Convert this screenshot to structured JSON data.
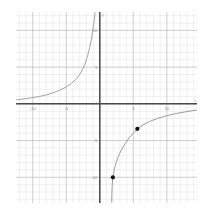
{
  "chart_data": {
    "type": "line",
    "title": "",
    "xlabel": "x",
    "ylabel": "y",
    "xlim": [
      -12.5,
      14.5
    ],
    "ylim": [
      -13.5,
      12.5
    ],
    "grid": true,
    "minor_grid": true,
    "minor_step": 1,
    "major_step": 5,
    "legend": "none",
    "x_ticks": [
      -10,
      -5,
      0,
      5,
      10
    ],
    "x_tick_labels": [
      "-10",
      "-5",
      "0",
      "5",
      "10"
    ],
    "y_ticks": [
      10,
      5,
      0,
      -5,
      -10
    ],
    "y_tick_labels": [
      "10",
      "5",
      "0",
      "-5",
      "-10"
    ],
    "series": [
      {
        "name": "upper-left-branch",
        "color": "#999999",
        "points": [
          {
            "x": -12.4,
            "y": 0.55
          },
          {
            "x": -11.0,
            "y": 0.7
          },
          {
            "x": -10.0,
            "y": 0.85
          },
          {
            "x": -9.0,
            "y": 1.0
          },
          {
            "x": -8.0,
            "y": 1.2
          },
          {
            "x": -7.0,
            "y": 1.5
          },
          {
            "x": -6.0,
            "y": 1.85
          },
          {
            "x": -5.0,
            "y": 2.3
          },
          {
            "x": -4.2,
            "y": 2.8
          },
          {
            "x": -3.5,
            "y": 3.4
          },
          {
            "x": -3.0,
            "y": 4.0
          },
          {
            "x": -2.5,
            "y": 4.8
          },
          {
            "x": -2.1,
            "y": 5.7
          },
          {
            "x": -1.8,
            "y": 6.6
          },
          {
            "x": -1.5,
            "y": 7.7
          },
          {
            "x": -1.25,
            "y": 8.8
          },
          {
            "x": -1.05,
            "y": 10.0
          },
          {
            "x": -0.85,
            "y": 11.2
          },
          {
            "x": -0.7,
            "y": 12.4
          }
        ]
      },
      {
        "name": "lower-right-branch",
        "color": "#8e8e8e",
        "points": [
          {
            "x": 1.78,
            "y": -13.4
          },
          {
            "x": 1.8,
            "y": -12.2
          },
          {
            "x": 1.85,
            "y": -11.1
          },
          {
            "x": 1.95,
            "y": -10.0
          },
          {
            "x": 2.15,
            "y": -9.0
          },
          {
            "x": 2.4,
            "y": -8.1
          },
          {
            "x": 2.75,
            "y": -7.2
          },
          {
            "x": 3.2,
            "y": -6.3
          },
          {
            "x": 3.8,
            "y": -5.4
          },
          {
            "x": 4.4,
            "y": -4.6
          },
          {
            "x": 5.1,
            "y": -3.9
          },
          {
            "x": 5.6,
            "y": -3.4
          },
          {
            "x": 6.4,
            "y": -2.9
          },
          {
            "x": 7.4,
            "y": -2.4
          },
          {
            "x": 8.6,
            "y": -2.0
          },
          {
            "x": 10.0,
            "y": -1.6
          },
          {
            "x": 11.5,
            "y": -1.3
          },
          {
            "x": 13.0,
            "y": -1.05
          },
          {
            "x": 14.4,
            "y": -0.85
          }
        ]
      }
    ],
    "marked_points": [
      {
        "x": 5.6,
        "y": -3.4,
        "label": ""
      },
      {
        "x": 1.95,
        "y": -10.0,
        "label": ""
      }
    ],
    "marker_color": "#111111"
  },
  "annotations": {
    "top_mark": "",
    "bottom_mark": ""
  },
  "colors": {
    "axis": "#4a4a4a",
    "major_grid": "#b9b9b9",
    "minor_grid": "#dedede",
    "curve": "#8e8e8e",
    "marker": "#111111",
    "background": "#ffffff",
    "tick_label": "#8d8d8d"
  }
}
